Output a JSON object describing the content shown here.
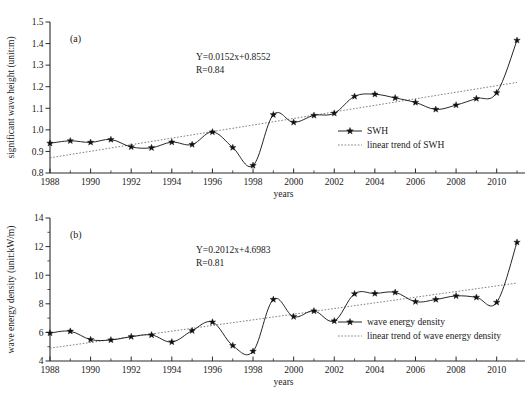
{
  "figure": {
    "background": "#ffffff",
    "line_color": "#1a1a1a",
    "trend_color": "#6a6a6a",
    "marker_color": "#111111"
  },
  "panels": [
    {
      "tag": "(a)",
      "xlabel": "years",
      "ylabel": "significant wave height (unit:m)",
      "equation": "Y=0.0152x+0.8552",
      "correlation": "R=0.84",
      "legend": [
        {
          "label": "SWH",
          "style": "line-marker"
        },
        {
          "label": "linear trend of SWH",
          "style": "dotted"
        }
      ]
    },
    {
      "tag": "(b)",
      "xlabel": "years",
      "ylabel": "wave energy density (unit:kW/m)",
      "equation": "Y=0.2012x+4.6983",
      "correlation": "R=0.81",
      "legend": [
        {
          "label": "wave energy density",
          "style": "line-marker"
        },
        {
          "label": "linear trend of wave energy density",
          "style": "dotted"
        }
      ]
    }
  ],
  "chart_data": [
    {
      "type": "line",
      "title": "(a)",
      "xlabel": "years",
      "ylabel": "significant wave height (unit:m)",
      "xlim": [
        1988,
        2011
      ],
      "ylim": [
        0.8,
        1.5
      ],
      "ytick_labels": [
        "0.8",
        "0.9",
        "1.0",
        "1.1",
        "1.2",
        "1.3",
        "1.4",
        "1.5"
      ],
      "yticks": [
        0.8,
        0.9,
        1.0,
        1.1,
        1.2,
        1.3,
        1.4,
        1.5
      ],
      "xtick_labels": [
        "1988",
        "1990",
        "1992",
        "1994",
        "1996",
        "1998",
        "2000",
        "2002",
        "2004",
        "2006",
        "2008",
        "2010"
      ],
      "xticks": [
        1988,
        1990,
        1992,
        1994,
        1996,
        1998,
        2000,
        2002,
        2004,
        2006,
        2008,
        2010
      ],
      "x": [
        1988,
        1989,
        1990,
        1991,
        1992,
        1993,
        1994,
        1995,
        1996,
        1997,
        1998,
        1999,
        2000,
        2001,
        2002,
        2003,
        2004,
        2005,
        2006,
        2007,
        2008,
        2009,
        2010,
        2011
      ],
      "series": [
        {
          "name": "SWH",
          "marker": "star",
          "values": [
            0.938,
            0.949,
            0.942,
            0.955,
            0.921,
            0.917,
            0.943,
            0.932,
            0.99,
            0.918,
            0.835,
            1.07,
            1.035,
            1.067,
            1.077,
            1.155,
            1.165,
            1.148,
            1.127,
            1.095,
            1.115,
            1.145,
            1.172,
            1.415
          ]
        }
      ],
      "trend": {
        "name": "linear trend of SWH",
        "equation": "Y=0.0152x+0.8552",
        "slope": 0.0152,
        "intercept": 0.8552,
        "r": 0.84,
        "style": "dotted",
        "x_start": 1988,
        "y_start": 0.8704,
        "x_end": 2011,
        "y_end": 1.22
      },
      "annotations": [
        "Y=0.0152x+0.8552",
        "R=0.84"
      ],
      "grid": false,
      "legend_position": "lower-right"
    },
    {
      "type": "line",
      "title": "(b)",
      "xlabel": "years",
      "ylabel": "wave energy density (unit:kW/m)",
      "xlim": [
        1988,
        2011
      ],
      "ylim": [
        4,
        14
      ],
      "ytick_labels": [
        "4",
        "6",
        "8",
        "10",
        "12",
        "14"
      ],
      "yticks": [
        4,
        6,
        8,
        10,
        12,
        14
      ],
      "xtick_labels": [
        "1988",
        "1990",
        "1992",
        "1994",
        "1996",
        "1998",
        "2000",
        "2002",
        "2004",
        "2006",
        "2008",
        "2010"
      ],
      "xticks": [
        1988,
        1990,
        1992,
        1994,
        1996,
        1998,
        2000,
        2002,
        2004,
        2006,
        2008,
        2010
      ],
      "x": [
        1988,
        1989,
        1990,
        1991,
        1992,
        1993,
        1994,
        1995,
        1996,
        1997,
        1998,
        1999,
        2000,
        2001,
        2002,
        2003,
        2004,
        2005,
        2006,
        2007,
        2008,
        2009,
        2010,
        2011
      ],
      "series": [
        {
          "name": "wave energy density",
          "marker": "star",
          "values": [
            5.95,
            6.08,
            5.5,
            5.47,
            5.7,
            5.82,
            5.33,
            6.12,
            6.72,
            5.08,
            4.68,
            8.3,
            7.1,
            7.5,
            6.8,
            8.7,
            8.72,
            8.8,
            8.15,
            8.3,
            8.55,
            8.45,
            8.1,
            12.3
          ]
        }
      ],
      "trend": {
        "name": "linear trend of wave energy density",
        "equation": "Y=0.2012x+4.6983",
        "slope": 0.2012,
        "intercept": 4.6983,
        "r": 0.81,
        "style": "dotted",
        "x_start": 1988,
        "y_start": 4.9,
        "x_end": 2011,
        "y_end": 9.45
      },
      "annotations": [
        "Y=0.2012x+4.6983",
        "R=0.81"
      ],
      "grid": false,
      "legend_position": "lower-right"
    }
  ]
}
